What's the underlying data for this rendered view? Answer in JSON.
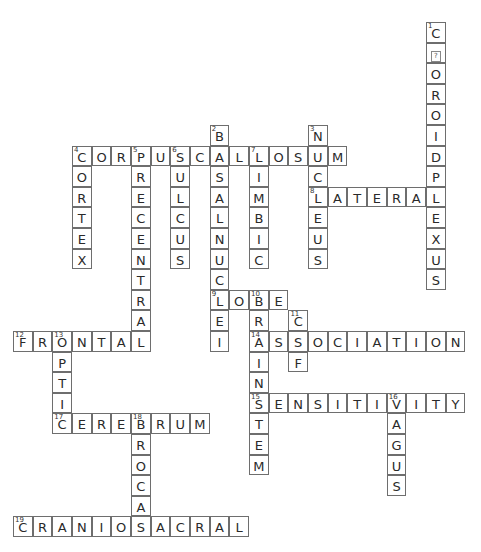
{
  "grid": {
    "origin_x": 13,
    "origin_y": 22,
    "cell_w": 19.67,
    "cell_h": 20.6
  },
  "words": [
    {
      "number": 1,
      "direction": "down",
      "row": 0,
      "col": 21,
      "answer": "C?OROIDPLEXUS",
      "display": [
        "C",
        "?",
        "O",
        "R",
        "O",
        "I",
        "D",
        "P",
        "L",
        "E",
        "X",
        "U",
        "S"
      ]
    },
    {
      "number": 2,
      "direction": "down",
      "row": 5,
      "col": 10,
      "answer": "BASALNUCLEI"
    },
    {
      "number": 3,
      "direction": "down",
      "row": 5,
      "col": 15,
      "answer": "NUCLEUS"
    },
    {
      "number": 4,
      "direction": "across",
      "row": 6,
      "col": 3,
      "answer": "CORPUSCALLOSUM"
    },
    {
      "number": 4,
      "direction": "down",
      "row": 6,
      "col": 3,
      "answer": "CORTEX"
    },
    {
      "number": 5,
      "direction": "down",
      "row": 6,
      "col": 6,
      "answer": "PRECENTRAL"
    },
    {
      "number": 6,
      "direction": "down",
      "row": 6,
      "col": 8,
      "answer": "SULCUS"
    },
    {
      "number": 7,
      "direction": "down",
      "row": 6,
      "col": 12,
      "answer": "LIMBIC"
    },
    {
      "number": 8,
      "direction": "across",
      "row": 8,
      "col": 15,
      "answer": "LATERAL"
    },
    {
      "number": 9,
      "direction": "across",
      "row": 13,
      "col": 10,
      "answer": "LOBE"
    },
    {
      "number": 10,
      "direction": "down",
      "row": 13,
      "col": 12,
      "answer": "BRAINSTEM"
    },
    {
      "number": 11,
      "direction": "down",
      "row": 14,
      "col": 14,
      "answer": "CSF"
    },
    {
      "number": 12,
      "direction": "across",
      "row": 15,
      "col": 0,
      "answer": "FRONTAL"
    },
    {
      "number": 13,
      "direction": "down",
      "row": 15,
      "col": 2,
      "answer": "OPTIC"
    },
    {
      "number": 14,
      "direction": "across",
      "row": 15,
      "col": 12,
      "answer": "ASSOCIATION"
    },
    {
      "number": 15,
      "direction": "across",
      "row": 18,
      "col": 12,
      "answer": "SENSITIVITY"
    },
    {
      "number": 16,
      "direction": "down",
      "row": 18,
      "col": 19,
      "answer": "VAGUS"
    },
    {
      "number": 17,
      "direction": "across",
      "row": 19,
      "col": 2,
      "answer": "CEREBRUM"
    },
    {
      "number": 18,
      "direction": "down",
      "row": 19,
      "col": 6,
      "answer": "BROCA"
    },
    {
      "number": 19,
      "direction": "across",
      "row": 24,
      "col": 0,
      "answer": "CRANIOSACRAL"
    }
  ],
  "colors": {
    "border": "#6e6e6e",
    "text": "#2a2a2a",
    "background": "#ffffff"
  }
}
